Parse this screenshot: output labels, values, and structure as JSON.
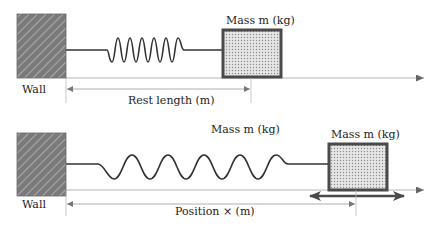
{
  "colors": {
    "wall_fill": "#7a7a7a",
    "wall_hatch": "#b8b8b8",
    "spring": "#333333",
    "mass_border": "#4a4a4a",
    "mass_fill": "#d9d9d9",
    "axis": "#b0b0b0",
    "dimension": "#9a9a9a",
    "double_arrow": "#4a4a4a",
    "text": "#222222"
  },
  "top_diagram": {
    "wall_label": "Wall",
    "mass_label": "Mass m (kg)",
    "dimension_label": "Rest length (m)"
  },
  "bottom_diagram": {
    "wall_label": "Wall",
    "floating_label": "Mass m (kg)",
    "mass_label": "Mass m (kg)",
    "dimension_label": "Position × (m)"
  }
}
